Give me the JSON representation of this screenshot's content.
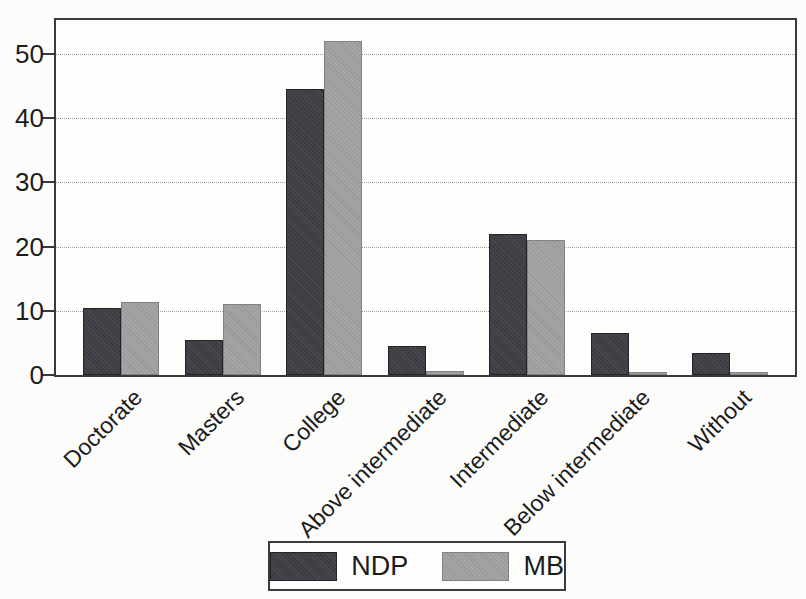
{
  "chart_data": {
    "type": "bar",
    "title": "",
    "categories": [
      "Doctorate",
      "Masters",
      "College",
      "Above intermediate",
      "Intermediate",
      "Below intermediate",
      "Without"
    ],
    "series": [
      {
        "name": "NDP",
        "color": "#3c3c42",
        "values": [
          10.5,
          5.5,
          44.5,
          4.5,
          22,
          6.5,
          3.5
        ]
      },
      {
        "name": "MB",
        "color": "#a5a5a5",
        "values": [
          11.3,
          11.1,
          52,
          0.7,
          21,
          0.5,
          0.4
        ]
      }
    ],
    "xlabel": "",
    "ylabel": "",
    "ylim": [
      0,
      55
    ],
    "yticks": [
      0,
      10,
      20,
      30,
      40,
      50
    ],
    "grid": "horizontal-dotted",
    "legend_position": "bottom",
    "x_tick_label_rotation_deg": 45
  },
  "legend": {
    "items": [
      {
        "label": "NDP",
        "color": "#3c3c42"
      },
      {
        "label": "MB",
        "color": "#a5a5a5"
      }
    ]
  },
  "colors": {
    "frame": "#3a3a3a",
    "gridline": "#9e9e9e",
    "text": "#1b1b1b",
    "paper": "#fcfcfb"
  }
}
